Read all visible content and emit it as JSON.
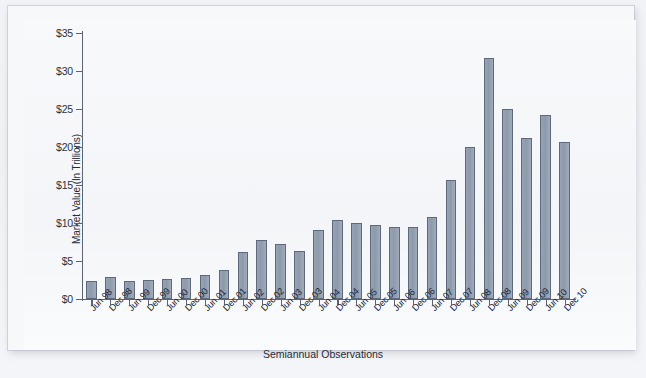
{
  "chart_data": {
    "type": "bar",
    "title": "",
    "xlabel": "Semiannual Observations",
    "ylabel": "Market Value (In Trillions)",
    "ylim": [
      0,
      35
    ],
    "ytick_values": [
      0,
      5,
      10,
      15,
      20,
      25,
      30,
      35
    ],
    "ytick_labels": [
      "$0",
      "$5",
      "$10",
      "$15",
      "$20",
      "$25",
      "$30",
      "$35"
    ],
    "grid": false,
    "legend": "none",
    "bar_color": "#8d9aab",
    "bar_edge_color": "#5e6a7b",
    "axis_color": "#5c6472",
    "categories": [
      "Jun 98",
      "Dec 98",
      "Jun 99",
      "Dec 99",
      "Jun 00",
      "Dec 00",
      "Jun 01",
      "Dec 01",
      "Jun 02",
      "Dec 02",
      "Jun 03",
      "Dec 03",
      "Jun 04",
      "Dec 04",
      "Jun 05",
      "Dec 05",
      "Jun 06",
      "Dec 06",
      "Jun 07",
      "Dec 07",
      "Jun 08",
      "Dec 08",
      "Jun 09",
      "Dec 09",
      "Jun 10",
      "Dec 10"
    ],
    "values": [
      2.4,
      2.9,
      2.4,
      2.5,
      2.6,
      2.8,
      3.1,
      3.8,
      6.2,
      7.7,
      7.2,
      6.3,
      9.1,
      10.4,
      10.0,
      9.7,
      9.5,
      9.5,
      10.8,
      15.6,
      20.0,
      31.7,
      25.0,
      21.2,
      24.2,
      20.7
    ]
  }
}
